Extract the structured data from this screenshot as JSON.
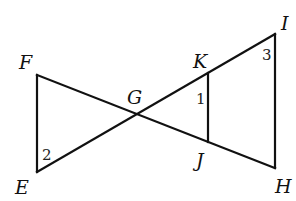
{
  "diagram": {
    "type": "geometry-figure",
    "points": {
      "F": {
        "label": "F",
        "x": 37,
        "y": 75
      },
      "E": {
        "label": "E",
        "x": 37,
        "y": 172
      },
      "G": {
        "label": "G",
        "x": 136,
        "y": 115
      },
      "K": {
        "label": "K",
        "x": 208,
        "y": 72
      },
      "J": {
        "label": "J",
        "x": 208,
        "y": 142
      },
      "I": {
        "label": "I",
        "x": 275,
        "y": 34
      },
      "H": {
        "label": "H",
        "x": 275,
        "y": 168
      }
    },
    "segments": [
      "FE",
      "FH",
      "EI",
      "KJ",
      "IH"
    ],
    "angles": [
      {
        "label": "1",
        "vertex": "K"
      },
      {
        "label": "2",
        "vertex": "E"
      },
      {
        "label": "3",
        "vertex": "I"
      }
    ],
    "colors": {
      "stroke": "#111111",
      "background": "#ffffff"
    }
  }
}
